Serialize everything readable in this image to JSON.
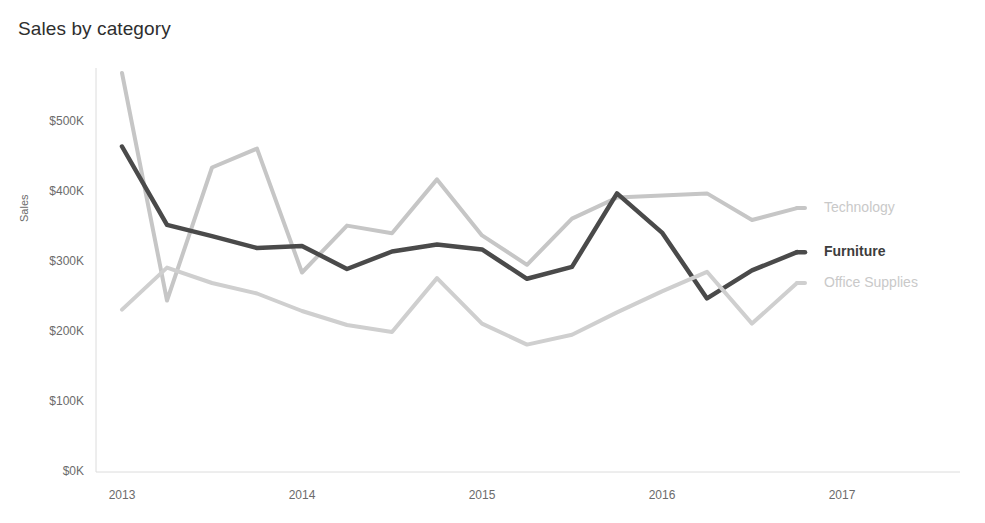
{
  "chart_data": {
    "type": "line",
    "title": "Sales by category",
    "xlabel": "",
    "ylabel": "Sales",
    "grid": false,
    "legend_position": "right-of-lines",
    "x_tick_labels": [
      "2013",
      "2014",
      "2015",
      "2016",
      "2017"
    ],
    "y_tick_labels": [
      "$0K",
      "$100K",
      "$200K",
      "$300K",
      "$400K",
      "$500K"
    ],
    "y_tick_values": [
      0,
      100000,
      200000,
      300000,
      400000,
      500000
    ],
    "ylim": [
      0,
      560000
    ],
    "xlim": [
      "2013-01",
      "2016-12"
    ],
    "x": [
      "2013-01",
      "2013-04",
      "2013-07",
      "2013-10",
      "2014-01",
      "2014-04",
      "2014-07",
      "2014-10",
      "2015-01",
      "2015-04",
      "2015-07",
      "2015-10",
      "2016-01",
      "2016-04",
      "2016-07",
      "2016-10"
    ],
    "series": [
      {
        "name": "Technology",
        "color": "#c6c6c6",
        "stroke_width": 4,
        "values": [
          570000,
          245000,
          435000,
          462000,
          285000,
          352000,
          341000,
          418000,
          338000,
          296000,
          362000,
          392000,
          395000,
          398000,
          360000,
          377000
        ]
      },
      {
        "name": "Furniture",
        "color": "#4a4a4a",
        "stroke_width": 4.5,
        "values": [
          465000,
          353000,
          337000,
          320000,
          323000,
          290000,
          315000,
          325000,
          318000,
          276000,
          293000,
          398000,
          342000,
          248000,
          288000,
          314000
        ]
      },
      {
        "name": "Office Supplies",
        "color": "#cfcfcf",
        "stroke_width": 4,
        "values": [
          232000,
          292000,
          270000,
          255000,
          230000,
          210000,
          200000,
          277000,
          212000,
          182000,
          196000,
          228000,
          258000,
          286000,
          212000,
          270000
        ]
      }
    ]
  },
  "axes": {
    "y_title": "Sales"
  }
}
